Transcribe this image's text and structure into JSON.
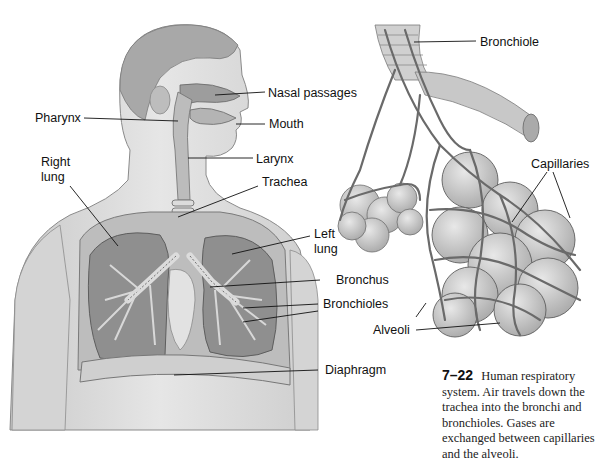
{
  "figure": {
    "number": "7–22",
    "caption": "Human respiratory system. Air travels down the trachea into the bronchi and bronchioles. Gases are exchanged between capillaries and the alveoli.",
    "left_panel": {
      "title": "Human torso with respiratory tract",
      "labels": [
        {
          "id": "nasal-passages",
          "text": "Nasal passages"
        },
        {
          "id": "pharynx",
          "text": "Pharynx"
        },
        {
          "id": "mouth",
          "text": "Mouth"
        },
        {
          "id": "right-lung",
          "text": "Right lung"
        },
        {
          "id": "larynx",
          "text": "Larynx"
        },
        {
          "id": "trachea",
          "text": "Trachea"
        },
        {
          "id": "left-lung",
          "text": "Left lung"
        },
        {
          "id": "bronchus",
          "text": "Bronchus"
        },
        {
          "id": "bronchioles",
          "text": "Bronchioles"
        },
        {
          "id": "diaphragm",
          "text": "Diaphragm"
        }
      ]
    },
    "right_panel": {
      "title": "Alveolar sacs detail",
      "labels": [
        {
          "id": "bronchiole",
          "text": "Bronchiole"
        },
        {
          "id": "capillaries",
          "text": "Capillaries"
        },
        {
          "id": "alveoli",
          "text": "Alveoli"
        }
      ]
    }
  },
  "labels_split": {
    "right_lung_line1": "Right",
    "right_lung_line2": "lung",
    "left_lung_line1": "Left",
    "left_lung_line2": "lung"
  }
}
